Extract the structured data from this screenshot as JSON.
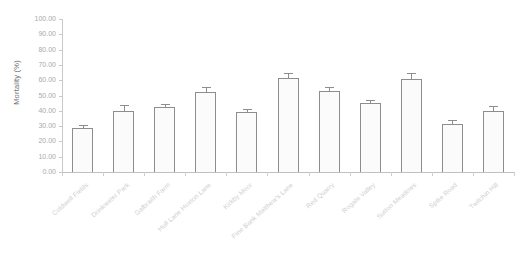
{
  "chart_data": {
    "type": "bar",
    "title": "",
    "xlabel": "",
    "ylabel": "Mortality (%)",
    "ylim": [
      0,
      100
    ],
    "ytick_labels": [
      "0.00",
      "10.00",
      "20.00",
      "30.00",
      "40.00",
      "50.00",
      "60.00",
      "70.00",
      "80.00",
      "90.00",
      "100.00"
    ],
    "ytick_values": [
      0,
      10,
      20,
      30,
      40,
      50,
      60,
      70,
      80,
      90,
      100
    ],
    "grid": false,
    "legend": false,
    "categories": [
      "Coldwell Fields",
      "Drinkwater Park",
      "Galbraith Farm",
      "Hull Lane Hoxton Lane",
      "Kirkby Moor",
      "Pine Bank Matthew's Lane",
      "Red Quarry",
      "Rogate Valley",
      "Sutton Meadows",
      "Spike Road",
      "Twitchin Hill"
    ],
    "values": [
      29.0,
      40.0,
      42.5,
      52.0,
      39.0,
      61.5,
      53.0,
      45.0,
      60.5,
      31.5,
      40.0
    ],
    "errors": [
      1.8,
      3.5,
      2.2,
      3.8,
      2.0,
      3.0,
      2.8,
      2.2,
      4.0,
      2.5,
      3.2
    ],
    "bar_facecolor": "#fbfbfb",
    "bar_edgecolor": "#8d8d8d",
    "axis_color": "#c9c9c9",
    "tick_label_color": "#a9a9a9",
    "xlabel_color": "#cfcfcf",
    "error_bar_style": "upper-only-with-caps"
  }
}
